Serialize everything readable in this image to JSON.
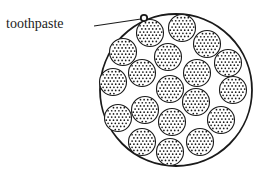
{
  "diagram": {
    "label": "toothpaste",
    "colors": {
      "stroke": "#1a1a1a",
      "dot": "#1a1a1a",
      "background": "#ffffff"
    },
    "outer_circle": {
      "cx": 176,
      "cy": 90,
      "r": 76
    },
    "marker": {
      "cx": 144,
      "cy": 18,
      "r": 3.2
    },
    "leader_line": {
      "x1": 94,
      "y1": 26,
      "x2": 141,
      "y2": 19
    },
    "small_circle_radius": 13.5,
    "small_circles": [
      {
        "cx": 150,
        "cy": 33
      },
      {
        "cx": 182,
        "cy": 28
      },
      {
        "cx": 207,
        "cy": 44
      },
      {
        "cx": 123,
        "cy": 52
      },
      {
        "cx": 168,
        "cy": 57
      },
      {
        "cx": 228,
        "cy": 63
      },
      {
        "cx": 142,
        "cy": 73
      },
      {
        "cx": 197,
        "cy": 73
      },
      {
        "cx": 113,
        "cy": 82
      },
      {
        "cx": 170,
        "cy": 89
      },
      {
        "cx": 233,
        "cy": 90
      },
      {
        "cx": 145,
        "cy": 110
      },
      {
        "cx": 196,
        "cy": 102
      },
      {
        "cx": 118,
        "cy": 118
      },
      {
        "cx": 172,
        "cy": 122
      },
      {
        "cx": 221,
        "cy": 120
      },
      {
        "cx": 142,
        "cy": 142
      },
      {
        "cx": 200,
        "cy": 142
      },
      {
        "cx": 170,
        "cy": 152
      }
    ]
  }
}
